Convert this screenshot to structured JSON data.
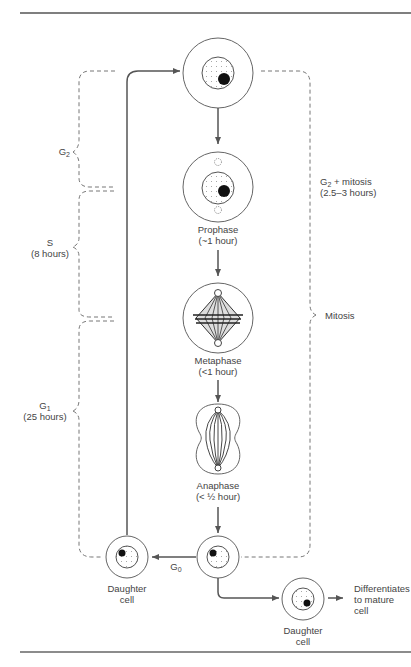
{
  "diagram": {
    "phases": {
      "g2": {
        "label": "G",
        "sub": "2"
      },
      "s": {
        "label": "S",
        "duration": "(8 hours)"
      },
      "g1": {
        "label": "G",
        "sub": "1",
        "duration": "(25 hours)"
      },
      "g0": {
        "label": "G",
        "sub": "0"
      },
      "g2_mitosis": {
        "label": "G",
        "sub": "2",
        "suffix": " + mitosis",
        "duration": "(2.5–3 hours)"
      },
      "mitosis": {
        "label": "Mitosis"
      }
    },
    "stages": [
      {
        "name": "Prophase",
        "duration": "(~1 hour)"
      },
      {
        "name": "Metaphase",
        "duration": "(<1 hour)"
      },
      {
        "name": "Anaphase",
        "duration": "(< ½ hour)"
      }
    ],
    "daughter_left": {
      "line1": "Daughter",
      "line2": "cell"
    },
    "daughter_right": {
      "line1": "Daughter",
      "line2": "cell"
    },
    "differentiates": {
      "line1": "Differentiates",
      "line2": "to mature",
      "line3": "cell"
    },
    "colors": {
      "line": "#555555",
      "dash": "#777777",
      "nucleolus": "#111111"
    }
  }
}
